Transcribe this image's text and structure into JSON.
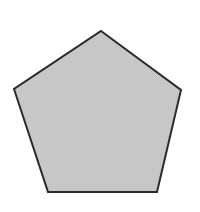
{
  "canvas": {
    "width": 200,
    "height": 212,
    "background_color": "#ffffff",
    "title": "Pentagon Shape"
  },
  "figure": {
    "name": "pentagon",
    "shape_type": "regular-pentagon",
    "sides": 5,
    "orientation": "point-up",
    "fill_color": "#c9c9c9",
    "fill_texture": "dithered-halftone",
    "texture_dot_color": "#b4b4b4",
    "stroke_color": "#2a2a2a",
    "stroke_width": 2,
    "points": "101,31 181,90 157,192 48,192 14,89",
    "vertices": [
      {
        "label": "apex",
        "x": 101,
        "y": 31
      },
      {
        "label": "right",
        "x": 181,
        "y": 90
      },
      {
        "label": "bottom-right",
        "x": 157,
        "y": 192
      },
      {
        "label": "bottom-left",
        "x": 48,
        "y": 192
      },
      {
        "label": "left",
        "x": 14,
        "y": 89
      }
    ],
    "center": {
      "x": 100,
      "y": 119
    },
    "circumradius": 89,
    "bounding_box": {
      "x": 14,
      "y": 31,
      "width": 167,
      "height": 161
    }
  }
}
